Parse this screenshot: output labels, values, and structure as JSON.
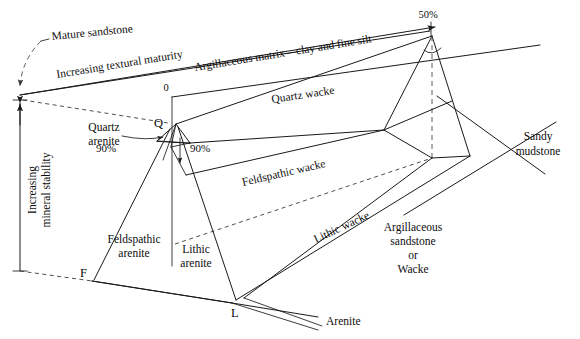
{
  "figure": {
    "title_none": "",
    "type": "sandstone-classification-prism-diagram",
    "vertices": {
      "q": "Q",
      "f": "F",
      "l": "L"
    },
    "axis_labels": {
      "zero": "0",
      "fifty_percent": "50%",
      "ninety_percent_left": "90%",
      "ninety_percent_right": "90%",
      "textural_maturity": "Increasing textural maturity",
      "mineral_stability_line1": "Increasing",
      "mineral_stability_line2": "mineral stability",
      "matrix_axis": "Argillaceous matrix—clay and fine silt"
    },
    "field_labels": {
      "mature_sandstone": "Mature sandstone",
      "quartz_arenite_line1": "Quartz",
      "quartz_arenite_line2": "arenite",
      "feldspathic_arenite_line1": "Feldspathic",
      "feldspathic_arenite_line2": "arenite",
      "lithic_arenite_line1": "Lithic",
      "lithic_arenite_line2": "arenite",
      "quartz_wacke": "Quartz wacke",
      "feldspathic_wacke": "Feldspathic wacke",
      "lithic_wacke": "Lithic wacke",
      "arenite": "Arenite",
      "sandy_mudstone_line1": "Sandy",
      "sandy_mudstone_line2": "mudstone",
      "argillaceous_line1": "Argillaceous",
      "argillaceous_line2": "sandstone",
      "argillaceous_line3": "or",
      "argillaceous_line4": "Wacke"
    },
    "colors": {
      "stroke": "#1a1a1a",
      "dashed": "#4a4a4a",
      "text": "#0d0d0d",
      "background": "#ffffff"
    }
  }
}
